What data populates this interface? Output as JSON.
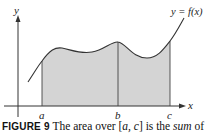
{
  "figure": {
    "y_axis_label": "y",
    "x_axis_label": "x",
    "curve_label": "y = f(x)",
    "tick_labels": [
      "a",
      "b",
      "c"
    ],
    "fill_color": "#d4d4d4",
    "line_color": "#333333"
  },
  "caption": {
    "figure_number": "FIGURE 9",
    "text_before": "The area over [",
    "interval": "a, c",
    "text_middle": "] is the ",
    "emphasis": "sum",
    "text_after": " of"
  }
}
